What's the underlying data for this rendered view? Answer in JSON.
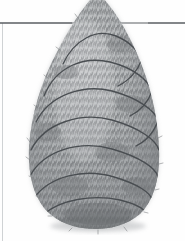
{
  "figure": {
    "medium": "grayscale pencil and wash illustration",
    "background_color": "#fefefe",
    "canvas": {
      "width": 185,
      "height": 241
    }
  },
  "rules": {
    "horizon_line": {
      "name": "horizon-line",
      "orientation": "horizontal",
      "y": 23,
      "x_start": 0,
      "x_end": 185,
      "color": "#5b5f63",
      "stroke_width": 1.1
    },
    "left_border_line": {
      "name": "left-border-line",
      "orientation": "vertical",
      "x": 2.5,
      "y_start": 23,
      "y_end": 241,
      "color": "#cfd2d4",
      "stroke_width": 1
    }
  },
  "tree": {
    "name": "conical-topiary",
    "silhouette": {
      "apex_x": 97,
      "apex_y": -6,
      "left_extreme_x": 29,
      "right_extreme_x": 159,
      "widest_y": 172,
      "base_y": 226,
      "base_left_x": 52,
      "base_right_x": 146
    },
    "fill_color": "#a9acae",
    "shadow_color": "#74777a",
    "highlight_color": "#c9cbcc",
    "foliage_texture": {
      "name": "needle-stipple",
      "stroke_color": "#6e7174",
      "stroke_count": 1000,
      "description": "dense short vertical strokes suggesting clipped evergreen foliage"
    },
    "base_shadow": {
      "name": "ground-shadow",
      "color": "#8d9093",
      "y": 224
    }
  },
  "garland": {
    "name": "spiral-garland",
    "color": "#4a4e52",
    "stroke_width": 1.35,
    "turns": 7,
    "description": "dark ribbon spiralling from apex down to base",
    "bands": [
      {
        "index": 1,
        "y_left": 62,
        "y_mid": 36,
        "y_right": 60
      },
      {
        "index": 2,
        "y_left": 92,
        "y_mid": 64,
        "y_right": 88
      },
      {
        "index": 3,
        "y_left": 118,
        "y_mid": 93,
        "y_right": 116
      },
      {
        "index": 4,
        "y_left": 146,
        "y_mid": 122,
        "y_right": 145
      },
      {
        "index": 5,
        "y_left": 173,
        "y_mid": 150,
        "y_right": 172
      },
      {
        "index": 6,
        "y_left": 196,
        "y_mid": 178,
        "y_right": 196
      },
      {
        "index": 7,
        "y_left": 214,
        "y_mid": 205,
        "y_right": 212
      }
    ]
  },
  "labels": {
    "figure_alt": "Grayscale drawing of a tall egg shaped evergreen topiary wrapped with a spiral garland, standing on a horizon line"
  }
}
